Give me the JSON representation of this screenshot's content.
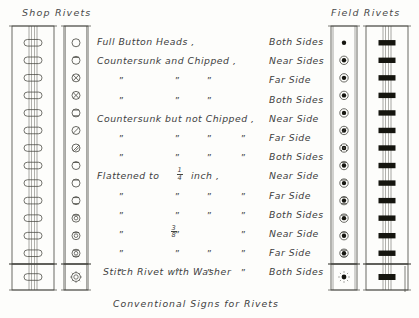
{
  "sheet": {
    "caption": "Conventional Signs for Rivets",
    "stitch_label": "Stitch Rivet with Washer"
  },
  "headings": {
    "shop": "Shop Rivets",
    "field": "Field Rivets"
  },
  "ditto": "”",
  "rows": [
    {
      "desc": "Full Button Heads ,",
      "side": "Both Sides",
      "ditto_cols": [],
      "shop_symbol": "open-circle",
      "field_symbol": "solid-dot",
      "elevation": "plain-rivet",
      "bar": "black-bar"
    },
    {
      "desc": "Countersunk and Chipped ,",
      "side": "Near Sides",
      "ditto_cols": [],
      "shop_symbol": "circle-square-near",
      "field_symbol": "dot-ring-near",
      "elevation": "plain-rivet",
      "bar": "black-bar"
    },
    {
      "desc": "",
      "side": "Far Side",
      "ditto_cols": [
        0,
        1,
        2
      ],
      "shop_symbol": "circle-cross-far",
      "field_symbol": "dot-ring-far",
      "elevation": "plain-rivet",
      "bar": "black-bar"
    },
    {
      "desc": "",
      "side": "Both Sides",
      "ditto_cols": [
        0,
        1,
        2
      ],
      "shop_symbol": "circle-cross-both",
      "field_symbol": "dot-ring-both",
      "elevation": "plain-rivet",
      "bar": "black-bar"
    },
    {
      "desc": "Countersunk but not Chipped ,",
      "side": "Near Side",
      "ditto_cols": [],
      "shop_symbol": "circle-square-open-near",
      "field_symbol": "dot-ring-open-near",
      "elevation": "plain-rivet",
      "bar": "black-bar"
    },
    {
      "desc": "",
      "side": "Far Side",
      "ditto_cols": [
        0,
        1,
        2,
        3
      ],
      "shop_symbol": "circle-slash-far",
      "field_symbol": "dot-ring-slash-far",
      "elevation": "plain-rivet",
      "bar": "black-bar"
    },
    {
      "desc": "",
      "side": "Both Sides",
      "ditto_cols": [
        0,
        1,
        2,
        3
      ],
      "shop_symbol": "circle-double-slash-both",
      "field_symbol": "dot-ring-slash-both",
      "elevation": "plain-rivet",
      "bar": "black-bar"
    },
    {
      "desc": "Flattened to",
      "side": "Near Side",
      "ditto_cols": [],
      "fraction": "1/4",
      "unit": "inch ,",
      "shop_symbol": "circle-flat-near",
      "field_symbol": "dot-ring-flat-near",
      "elevation": "plain-rivet",
      "bar": "black-bar"
    },
    {
      "desc": "",
      "side": "Far Side",
      "ditto_cols": [
        0,
        1,
        2,
        3
      ],
      "shop_symbol": "circle-flat-far",
      "field_symbol": "dot-ring-flat-far",
      "elevation": "plain-rivet",
      "bar": "black-bar"
    },
    {
      "desc": "",
      "side": "Both Sides",
      "ditto_cols": [
        0,
        1,
        2,
        3
      ],
      "shop_symbol": "circle-flat-both",
      "field_symbol": "dot-ring-flat-both",
      "elevation": "plain-rivet",
      "bar": "black-bar"
    },
    {
      "desc": "",
      "side": "Near Side",
      "ditto_cols": [
        0,
        1,
        3
      ],
      "fraction": "3/8",
      "shop_symbol": "circle-flat38-near",
      "field_symbol": "dot-ring-flat38-near",
      "elevation": "plain-rivet",
      "bar": "black-bar"
    },
    {
      "desc": "",
      "side": "Far Side",
      "ditto_cols": [
        0,
        1,
        2,
        3
      ],
      "shop_symbol": "circle-flat38-far",
      "field_symbol": "dot-ring-flat38-far",
      "elevation": "plain-rivet",
      "bar": "black-bar"
    },
    {
      "desc": "",
      "side": "Both Sides",
      "ditto_cols": [
        0,
        1,
        2,
        3
      ],
      "shop_symbol": "circle-flat38-both",
      "field_symbol": "dot-ring-flat38-both",
      "elevation": "plain-rivet",
      "bar": "black-bar"
    }
  ],
  "stitch_row": {
    "shop_elevation": "stitch-rivet-elevation",
    "shop_symbol": "circle-washer",
    "field_symbol": "dot-washer",
    "field_bar": "black-bar-washer"
  },
  "fractions": {
    "quarter": {
      "num": "1",
      "den": "4"
    },
    "three_eighths": {
      "num": "3",
      "den": "8"
    }
  },
  "colors": {
    "ink": "#45453f",
    "fill_black": "#15150f",
    "paper": "#fdfdfb"
  }
}
